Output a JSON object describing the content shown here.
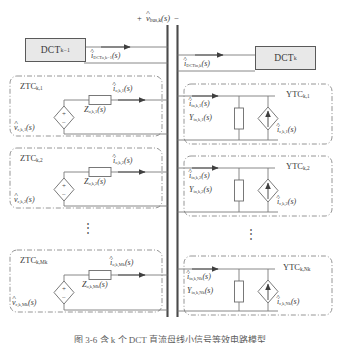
{
  "figure": {
    "type": "circuit-diagram",
    "caption": "图 3-6  含 k 个 DCT 直流母线小信号等效电路模型",
    "bus": {
      "polarity_plus": "+",
      "polarity_minus": "−",
      "voltage_label": "v̂",
      "voltage_sub": "bus,k",
      "voltage_arg": "(s)"
    },
    "converters": [
      {
        "name": "DCT",
        "sub": "k−1",
        "side": "left",
        "current_label": "î",
        "current_sub": "DCTo,k−1",
        "current_arg": "(s)"
      },
      {
        "name": "DCT",
        "sub": "k",
        "side": "right",
        "current_label": "î",
        "current_sub": "DCTin,k",
        "current_arg": "(s)"
      }
    ],
    "left_column_title": "ZTC",
    "right_column_title": "YTC",
    "ztc_blocks": [
      {
        "title": "ZTC",
        "title_sub": "k,1",
        "source_label": "v̂",
        "source_sub": "c,k,1",
        "source_arg": "(s)",
        "source_plus": "+",
        "source_minus": "−",
        "impedance_label": "Z",
        "impedance_sub": "o,k,1",
        "impedance_arg": "(s)",
        "current_label": "î",
        "current_sub": "o,k,1",
        "current_arg": "(s)"
      },
      {
        "title": "ZTC",
        "title_sub": "k,2",
        "source_label": "v̂",
        "source_sub": "c,k,2",
        "source_arg": "(s)",
        "source_plus": "+",
        "source_minus": "−",
        "impedance_label": "Z",
        "impedance_sub": "o,k,2",
        "impedance_arg": "(s)",
        "current_label": "î",
        "current_sub": "o,k,2",
        "current_arg": "(s)"
      },
      {
        "title": "ZTC",
        "title_sub": "k,Mk",
        "source_label": "v̂",
        "source_sub": "c,k,Mk",
        "source_arg": "(s)",
        "source_plus": "+",
        "source_minus": "−",
        "impedance_label": "Z",
        "impedance_sub": "o,k,Mk",
        "impedance_arg": "(s)",
        "current_label": "î",
        "current_sub": "o,k,Mk",
        "current_arg": "(s)"
      }
    ],
    "ytc_blocks": [
      {
        "title": "YTC",
        "title_sub": "k,1",
        "admittance_label": "Y",
        "admittance_sub": "in,k,1",
        "admittance_arg": "(s)",
        "source_label": "î",
        "source_sub": "c,k,1",
        "source_arg": "(s)",
        "current_label": "î",
        "current_sub": "in,k,1",
        "current_arg": "(s)"
      },
      {
        "title": "YTC",
        "title_sub": "k,2",
        "admittance_label": "Y",
        "admittance_sub": "in,k,2",
        "admittance_arg": "(s)",
        "source_label": "î",
        "source_sub": "c,k,2",
        "source_arg": "(s)",
        "current_label": "î",
        "current_sub": "in,k,2",
        "current_arg": "(s)"
      },
      {
        "title": "YTC",
        "title_sub": "k,Nk",
        "admittance_label": "Y",
        "admittance_sub": "in,k,Nk",
        "admittance_arg": "(s)",
        "source_label": "î",
        "source_sub": "c,k,Nk",
        "source_arg": "(s)",
        "current_label": "î",
        "current_sub": "in,k,Nk",
        "current_arg": "(s)"
      }
    ],
    "ellipsis": "⋮",
    "colors": {
      "line": "#6b6b6b",
      "block_fill": "#e8e8e8",
      "block_border": "#5a5a5a",
      "text": "#3a3a3a",
      "background": "#ffffff"
    }
  }
}
